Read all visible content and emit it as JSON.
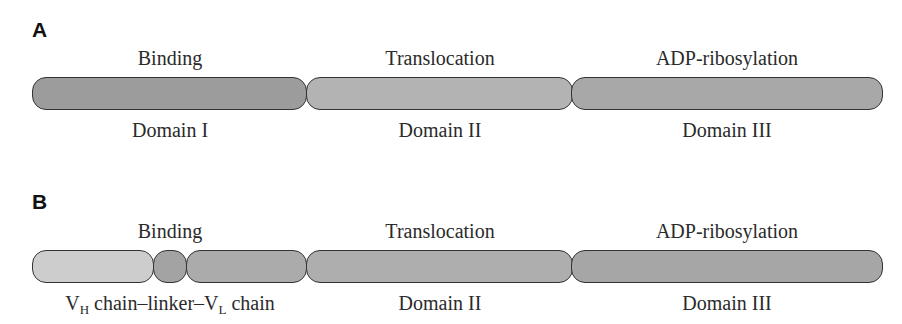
{
  "panels": [
    {
      "label": "A",
      "top_labels": [
        {
          "text": "Binding",
          "cx": 170
        },
        {
          "text": "Translocation",
          "cx": 440
        },
        {
          "text": "ADP-ribosylation",
          "cx": 727
        }
      ],
      "segments": [
        {
          "name": "domain-i",
          "x": 32,
          "w": 275,
          "color": "#9c9c9c"
        },
        {
          "name": "domain-ii",
          "x": 306,
          "w": 267,
          "color": "#b3b3b3"
        },
        {
          "name": "domain-iii",
          "x": 571,
          "w": 312,
          "color": "#a8a8a8"
        }
      ],
      "bottom_labels": [
        {
          "text": "Domain I",
          "cx": 170
        },
        {
          "text": "Domain II",
          "cx": 440
        },
        {
          "text": "Domain III",
          "cx": 727
        }
      ]
    },
    {
      "label": "B",
      "top_labels": [
        {
          "text": "Binding",
          "cx": 170
        },
        {
          "text": "Translocation",
          "cx": 440
        },
        {
          "text": "ADP-ribosylation",
          "cx": 727
        }
      ],
      "segments": [
        {
          "name": "vh-chain",
          "x": 32,
          "w": 122,
          "color": "#cdcdcd"
        },
        {
          "name": "linker",
          "x": 153,
          "w": 34,
          "color": "#a3a3a3"
        },
        {
          "name": "vl-chain",
          "x": 186,
          "w": 121,
          "color": "#ababab"
        },
        {
          "name": "domain-ii",
          "x": 306,
          "w": 267,
          "color": "#aeaeae"
        },
        {
          "name": "domain-iii",
          "x": 571,
          "w": 312,
          "color": "#a6a6a6"
        }
      ],
      "bottom_labels": [
        {
          "text": "chain–linker–",
          "cx": 170
        },
        {
          "text": "Domain II",
          "cx": 440
        },
        {
          "text": "Domain III",
          "cx": 727
        }
      ],
      "vh": {
        "V": "V",
        "sub": "H",
        "rest": " chain–linker–"
      },
      "vl": {
        "V": "V",
        "sub": "L",
        "rest": " chain"
      }
    }
  ]
}
